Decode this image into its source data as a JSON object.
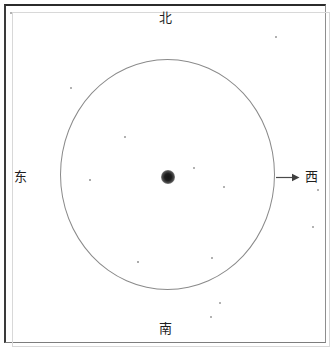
{
  "figure": {
    "type": "orbital-direction-diagram",
    "title_text": "",
    "background_color": "#ffffff",
    "frame": {
      "border_color_dark": "#2b2b2b",
      "border_color_light": "#8e8e8e"
    }
  },
  "directions": {
    "north": {
      "label": "北",
      "meaning": "north",
      "position": "top-center"
    },
    "south": {
      "label": "南",
      "meaning": "south",
      "position": "bottom-center"
    },
    "east": {
      "label": "东",
      "meaning": "east",
      "position": "left-middle"
    },
    "west": {
      "label": "西",
      "meaning": "west",
      "position": "right-middle"
    }
  },
  "elements": {
    "orbit_circle": {
      "name": "orbit-circle",
      "stroke_color": "#8a8a8a",
      "center_x": 168,
      "center_y": 175,
      "radius_x": 108,
      "radius_y": 116
    },
    "center_body": {
      "name": "center-body",
      "color": "#141414",
      "center_x": 168,
      "center_y": 177,
      "radius": 7
    },
    "direction_arrow": {
      "name": "west-direction-arrow",
      "color": "#4a4a4a",
      "from_x": 277,
      "to_x": 298,
      "y": 177,
      "points_to": "西"
    }
  },
  "specks": [
    {
      "x": 11,
      "y": 13,
      "r": 1.1
    },
    {
      "x": 71,
      "y": 88,
      "r": 1.0
    },
    {
      "x": 125,
      "y": 137,
      "r": 0.9
    },
    {
      "x": 194,
      "y": 168,
      "r": 1.0
    },
    {
      "x": 224,
      "y": 187,
      "r": 1.1
    },
    {
      "x": 90,
      "y": 180,
      "r": 0.8
    },
    {
      "x": 212,
      "y": 258,
      "r": 0.9
    },
    {
      "x": 138,
      "y": 262,
      "r": 0.8
    },
    {
      "x": 220,
      "y": 303,
      "r": 1.0
    },
    {
      "x": 211,
      "y": 317,
      "r": 1.0
    },
    {
      "x": 276,
      "y": 37,
      "r": 0.9
    },
    {
      "x": 318,
      "y": 190,
      "r": 1.0
    },
    {
      "x": 313,
      "y": 227,
      "r": 1.0
    }
  ]
}
